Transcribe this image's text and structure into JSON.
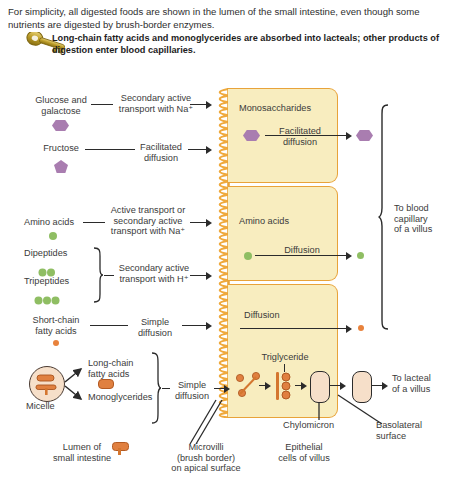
{
  "figure": {
    "intro_text": "For simplicity, all digested foods are shown in the lumen of the small intestine, even though some nutrients are digested by brush-border enzymes.",
    "key_note": "Long-chain fatty acids and monoglycerides are absorbed into lacteals; other products of digestion enter blood capillaries.",
    "key_icon": "key-icon"
  },
  "lumen": {
    "rows": [
      {
        "substrate": "Glucose and\ngalactose",
        "shape": "hexagon",
        "mechanism": "Secondary active\ntransport with Na⁺"
      },
      {
        "substrate": "Fructose",
        "shape": "pentagon",
        "mechanism": "Facilitated\ndiffusion"
      },
      {
        "substrate": "Amino acids",
        "shape": "circle-green",
        "mechanism": "Active transport or\nsecondary active\ntransport with Na⁺"
      },
      {
        "substrate": "Dipeptides",
        "shape": "two-green-circles",
        "mechanism": "Secondary active\ntransport with H⁺"
      },
      {
        "substrate": "Tripeptides",
        "shape": "three-green-circles",
        "mechanism": "Secondary active\ntransport with H⁺"
      },
      {
        "substrate": "Short-chain\nfatty acids",
        "shape": "small-orange-dot",
        "mechanism": "Simple\ndiffusion"
      },
      {
        "substrate": "Long-chain\nfatty acids",
        "shape": "orange-oval",
        "mechanism": "Simple\ndiffusion"
      },
      {
        "substrate": "Monoglycerides",
        "shape": "orange-oval-with-stem",
        "mechanism": "Simple\ndiffusion"
      }
    ],
    "micelle_label": "Micelle",
    "bottom_label": "Lumen of\nsmall intestine"
  },
  "cells": {
    "boxes": [
      {
        "title": "Monosaccharides",
        "transport": "Facilitated\ndiffusion"
      },
      {
        "title": "Amino acids",
        "transport": "Diffusion"
      },
      {
        "title": "",
        "transport": "Diffusion"
      }
    ],
    "triglyceride_label": "Triglyceride",
    "chylomicron_label": "Chylomicron",
    "basolateral_label": "Basolateral\nsurface",
    "microvilli_label": "Microvilli\n(brush border)\non apical surface",
    "epithelial_label": "Epithelial\ncells of villus"
  },
  "destinations": {
    "blood": "To blood\ncapillary\nof a villus",
    "lacteal": "To lacteal\nof a villus"
  },
  "colors": {
    "cell_fill": "#f8edbf",
    "cell_border": "#e8a33a",
    "sugar": "#a97db0",
    "amino": "#8fbe63",
    "lipid": "#e08040",
    "microvilli": "#efa93c",
    "text": "#3b3b3b"
  }
}
